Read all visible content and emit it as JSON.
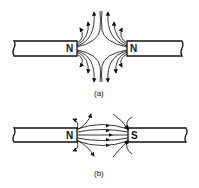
{
  "figure_a": {
    "caption": "(a)",
    "left_magnet_pole": "N",
    "right_magnet_pole": "N",
    "description": "Like poles facing: field lines repel and bend outward"
  },
  "figure_b": {
    "caption": "(b)",
    "left_magnet_pole": "N",
    "right_magnet_pole": "S",
    "description": "Unlike poles facing: field lines pass from N to S"
  },
  "colors": {
    "ink": "#111111",
    "background": "#ffffff"
  }
}
